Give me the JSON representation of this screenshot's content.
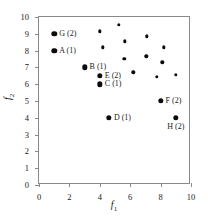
{
  "chart_data": {
    "type": "scatter",
    "title": "",
    "xlabel": "f1",
    "ylabel": "f2",
    "xlim": [
      0,
      10
    ],
    "ylim": [
      0,
      10
    ],
    "grid": false,
    "legend": "none",
    "x_ticks": [
      "0",
      "2",
      "4",
      "6",
      "8",
      "10"
    ],
    "x_tick_values": [
      0,
      2,
      4,
      6,
      8,
      10
    ],
    "y_ticks": [
      "0",
      "1",
      "2",
      "3",
      "4",
      "5",
      "6",
      "7",
      "8",
      "9",
      "10"
    ],
    "y_tick_values": [
      0,
      1,
      2,
      3,
      4,
      5,
      6,
      7,
      8,
      9,
      10
    ],
    "marker_color": "#0b0b0b",
    "frame_color": "#8a8a8a",
    "labeled_points": [
      {
        "label": "G (2)",
        "name": "G",
        "rank": 2,
        "x": 1.0,
        "y": 9.0,
        "label_pos": "right"
      },
      {
        "label": "A (1)",
        "name": "A",
        "rank": 1,
        "x": 1.0,
        "y": 8.0,
        "label_pos": "right"
      },
      {
        "label": "B (1)",
        "name": "B",
        "rank": 1,
        "x": 3.0,
        "y": 7.0,
        "label_pos": "right"
      },
      {
        "label": "E (2)",
        "name": "E",
        "rank": 2,
        "x": 4.0,
        "y": 6.5,
        "label_pos": "right"
      },
      {
        "label": "C (1)",
        "name": "C",
        "rank": 1,
        "x": 4.0,
        "y": 6.0,
        "label_pos": "right"
      },
      {
        "label": "D (1)",
        "name": "D",
        "rank": 1,
        "x": 4.6,
        "y": 4.0,
        "label_pos": "right"
      },
      {
        "label": "F (2)",
        "name": "F",
        "rank": 2,
        "x": 8.0,
        "y": 5.0,
        "label_pos": "right"
      },
      {
        "label": "H (2)",
        "name": "H",
        "rank": 2,
        "x": 9.0,
        "y": 4.0,
        "label_pos": "below"
      }
    ],
    "unlabeled_points": [
      {
        "x": 4.0,
        "y": 9.15
      },
      {
        "x": 5.25,
        "y": 9.55
      },
      {
        "x": 4.2,
        "y": 8.2
      },
      {
        "x": 5.65,
        "y": 8.55
      },
      {
        "x": 7.1,
        "y": 8.85
      },
      {
        "x": 8.2,
        "y": 8.2
      },
      {
        "x": 5.6,
        "y": 7.5
      },
      {
        "x": 7.05,
        "y": 7.65
      },
      {
        "x": 8.1,
        "y": 7.3
      },
      {
        "x": 6.2,
        "y": 6.7
      },
      {
        "x": 7.75,
        "y": 6.45
      },
      {
        "x": 9.0,
        "y": 6.55
      }
    ]
  }
}
